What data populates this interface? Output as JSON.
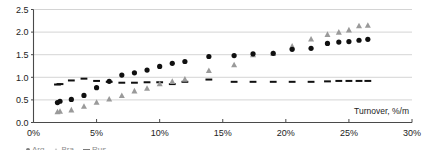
{
  "chart_data": {
    "type": "scatter",
    "title": "",
    "xlabel": "Turnover, %/m",
    "ylabel": "",
    "xlim": [
      0,
      30
    ],
    "ylim": [
      0,
      2.5
    ],
    "grid": true,
    "x_ticks": [
      "0%",
      "5%",
      "10%",
      "15%",
      "20%",
      "25%",
      "30%"
    ],
    "x_tick_values": [
      0,
      5,
      10,
      15,
      20,
      25,
      30
    ],
    "y_ticks": [
      "0.0",
      "0.5",
      "1.0",
      "1.5",
      "2.0",
      "2.5"
    ],
    "y_tick_values": [
      0.0,
      0.5,
      1.0,
      1.5,
      2.0,
      2.5
    ],
    "legend_position": "bottom",
    "series": [
      {
        "name": "circles",
        "marker": "circle",
        "color": "#101010",
        "points": [
          [
            1.9,
            0.44
          ],
          [
            2.1,
            0.47
          ],
          [
            3.0,
            0.51
          ],
          [
            4.0,
            0.6
          ],
          [
            5.0,
            0.77
          ],
          [
            6.0,
            0.91
          ],
          [
            7.0,
            1.05
          ],
          [
            8.0,
            1.1
          ],
          [
            9.0,
            1.16
          ],
          [
            10.0,
            1.24
          ],
          [
            11.0,
            1.31
          ],
          [
            12.0,
            1.35
          ],
          [
            13.9,
            1.46
          ],
          [
            15.9,
            1.48
          ],
          [
            17.4,
            1.52
          ],
          [
            19.0,
            1.53
          ],
          [
            20.5,
            1.62
          ],
          [
            22.0,
            1.64
          ],
          [
            23.3,
            1.75
          ],
          [
            24.2,
            1.78
          ],
          [
            25.0,
            1.79
          ],
          [
            25.8,
            1.82
          ],
          [
            26.5,
            1.84
          ]
        ]
      },
      {
        "name": "triangles",
        "marker": "triangle",
        "color": "#9a9a9a",
        "points": [
          [
            1.9,
            0.24
          ],
          [
            2.1,
            0.25
          ],
          [
            3.0,
            0.28
          ],
          [
            4.0,
            0.36
          ],
          [
            5.0,
            0.45
          ],
          [
            6.0,
            0.52
          ],
          [
            7.0,
            0.6
          ],
          [
            8.0,
            0.7
          ],
          [
            9.0,
            0.76
          ],
          [
            10.0,
            0.86
          ],
          [
            11.0,
            0.91
          ],
          [
            12.0,
            0.96
          ],
          [
            13.9,
            1.15
          ],
          [
            15.9,
            1.28
          ],
          [
            17.4,
            1.5
          ],
          [
            19.0,
            1.53
          ],
          [
            20.5,
            1.69
          ],
          [
            22.0,
            1.85
          ],
          [
            23.3,
            1.95
          ],
          [
            24.2,
            2.0
          ],
          [
            25.0,
            2.05
          ],
          [
            25.8,
            2.14
          ],
          [
            26.5,
            2.15
          ]
        ]
      },
      {
        "name": "dashes",
        "marker": "dash",
        "color": "#101010",
        "points": [
          [
            1.9,
            0.84
          ],
          [
            2.1,
            0.85
          ],
          [
            3.0,
            0.93
          ],
          [
            4.0,
            0.97
          ],
          [
            5.0,
            0.92
          ],
          [
            6.0,
            0.9
          ],
          [
            7.0,
            0.88
          ],
          [
            8.0,
            0.88
          ],
          [
            9.0,
            0.89
          ],
          [
            10.0,
            0.89
          ],
          [
            11.0,
            0.85
          ],
          [
            12.0,
            0.9
          ],
          [
            13.9,
            0.95
          ],
          [
            15.9,
            0.9
          ],
          [
            17.4,
            0.9
          ],
          [
            19.0,
            0.9
          ],
          [
            20.5,
            0.9
          ],
          [
            22.0,
            0.9
          ],
          [
            23.3,
            0.91
          ],
          [
            24.2,
            0.92
          ],
          [
            25.0,
            0.92
          ],
          [
            25.8,
            0.92
          ],
          [
            26.5,
            0.92
          ]
        ]
      }
    ],
    "legend_entries": [
      {
        "label": "Arg",
        "marker": "circle"
      },
      {
        "label": "Bra",
        "marker": "triangle"
      },
      {
        "label": "Rus",
        "marker": "dash"
      }
    ]
  }
}
